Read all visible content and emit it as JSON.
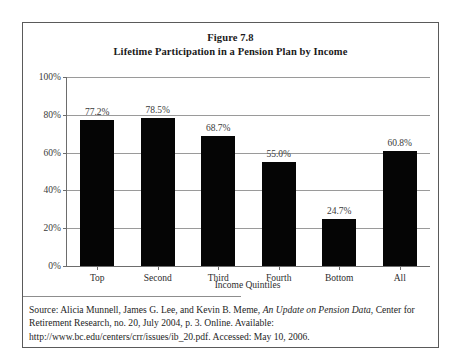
{
  "figure": {
    "title_line1": "Figure 7.8",
    "title_line2": "Lifetime Participation in a Pension Plan by Income"
  },
  "source": {
    "prefix": "Source: Alicia Munnell, James G. Lee, and Kevin B. Meme, ",
    "italic_title": "An Update on Pension Data",
    "suffix": ", Center for Retirement Research, no. 20, July 2004, p. 3. Online. Available: http://www.bc.edu/centers/crr/issues/ib_20.pdf. Accessed: May 10, 2006."
  },
  "chart_data": {
    "type": "bar",
    "title": "Lifetime Participation in a Pension Plan by Income",
    "categories": [
      "Top",
      "Second",
      "Third",
      "Fourth",
      "Bottom",
      "All"
    ],
    "values": [
      77.2,
      78.5,
      68.7,
      55.0,
      24.7,
      60.8
    ],
    "data_labels": [
      "77.2%",
      "78.5%",
      "68.7%",
      "55.0%",
      "24.7%",
      "60.8%"
    ],
    "xlabel": "Income Quintiles",
    "ylabel": "",
    "ylim": [
      0,
      100
    ],
    "ytick_values": [
      0,
      20,
      40,
      60,
      80,
      100
    ],
    "ytick_labels": [
      "0%",
      "20%",
      "40%",
      "60%",
      "80%",
      "100%"
    ],
    "grid": true,
    "legend": "none",
    "bar_color": "#050505"
  }
}
